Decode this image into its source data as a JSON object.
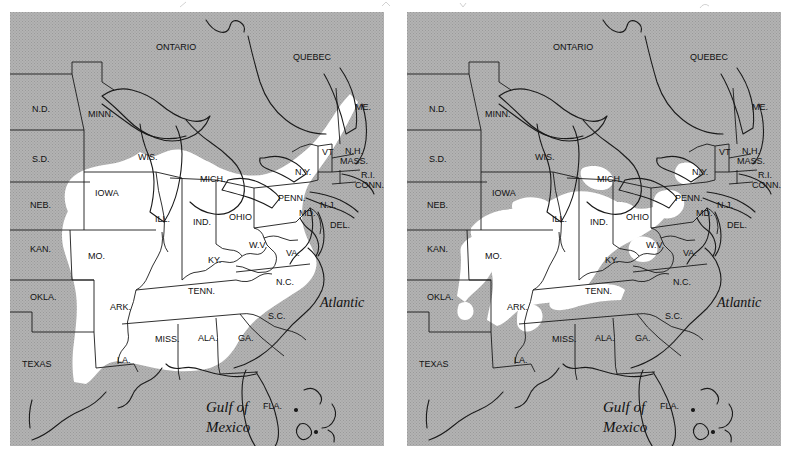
{
  "figure": {
    "type": "two-panel-range-map",
    "panel_count": 2,
    "background_color": "#ffffff",
    "land_shade_color": "#b4b4b4",
    "range_fill_color": "#ffffff",
    "outline_color": "#1a1a1a"
  },
  "maps": [
    {
      "id": "map-left",
      "position": "left",
      "ocean_labels": [
        {
          "text": "Atlantic",
          "x": 310,
          "y": 295,
          "style": "italic-serif",
          "size": 14
        },
        {
          "text": "Gulf of",
          "x": 196,
          "y": 400,
          "style": "italic-serif",
          "size": 15
        },
        {
          "text": "Mexico",
          "x": 196,
          "y": 420,
          "style": "italic-serif",
          "size": 15
        }
      ],
      "labels": [
        {
          "text": "ONTARIO",
          "x": 146,
          "y": 38
        },
        {
          "text": "QUEBEC",
          "x": 283,
          "y": 48
        },
        {
          "text": "N.D.",
          "x": 22,
          "y": 100
        },
        {
          "text": "MINN.",
          "x": 78,
          "y": 105
        },
        {
          "text": "S.D.",
          "x": 22,
          "y": 150
        },
        {
          "text": "WIS.",
          "x": 128,
          "y": 148
        },
        {
          "text": "MICH.",
          "x": 190,
          "y": 170
        },
        {
          "text": "N.Y.",
          "x": 285,
          "y": 163
        },
        {
          "text": "ME.",
          "x": 345,
          "y": 98
        },
        {
          "text": "VT",
          "x": 312,
          "y": 143
        },
        {
          "text": "N.H.",
          "x": 335,
          "y": 142
        },
        {
          "text": "MASS.",
          "x": 330,
          "y": 152
        },
        {
          "text": "R.I.",
          "x": 351,
          "y": 166
        },
        {
          "text": "CONN.",
          "x": 345,
          "y": 176
        },
        {
          "text": "NEB.",
          "x": 20,
          "y": 196
        },
        {
          "text": "IOWA",
          "x": 85,
          "y": 184
        },
        {
          "text": "ILL.",
          "x": 145,
          "y": 210
        },
        {
          "text": "IND.",
          "x": 183,
          "y": 213
        },
        {
          "text": "OHIO",
          "x": 219,
          "y": 208
        },
        {
          "text": "PENN.",
          "x": 268,
          "y": 189
        },
        {
          "text": "N.J.",
          "x": 310,
          "y": 196
        },
        {
          "text": "MD.",
          "x": 289,
          "y": 204
        },
        {
          "text": "DEL.",
          "x": 320,
          "y": 216
        },
        {
          "text": "KAN.",
          "x": 20,
          "y": 240
        },
        {
          "text": "MO.",
          "x": 78,
          "y": 247
        },
        {
          "text": "KY.",
          "x": 198,
          "y": 251
        },
        {
          "text": "W.V.",
          "x": 239,
          "y": 236
        },
        {
          "text": "VA.",
          "x": 276,
          "y": 244
        },
        {
          "text": "OKLA.",
          "x": 20,
          "y": 288
        },
        {
          "text": "ARK.",
          "x": 100,
          "y": 298
        },
        {
          "text": "TENN.",
          "x": 178,
          "y": 282
        },
        {
          "text": "N.C.",
          "x": 266,
          "y": 273
        },
        {
          "text": "S.C.",
          "x": 258,
          "y": 307
        },
        {
          "text": "MISS.",
          "x": 145,
          "y": 330
        },
        {
          "text": "ALA.",
          "x": 188,
          "y": 329
        },
        {
          "text": "GA.",
          "x": 228,
          "y": 329
        },
        {
          "text": "TEXAS",
          "x": 12,
          "y": 355
        },
        {
          "text": "LA.",
          "x": 107,
          "y": 351
        },
        {
          "text": "FLA.",
          "x": 253,
          "y": 397
        }
      ]
    },
    {
      "id": "map-right",
      "position": "right",
      "ocean_labels": [
        {
          "text": "Atlantic",
          "x": 310,
          "y": 295,
          "style": "italic-serif",
          "size": 14
        },
        {
          "text": "Gulf of",
          "x": 196,
          "y": 400,
          "style": "italic-serif",
          "size": 15
        },
        {
          "text": "Mexico",
          "x": 196,
          "y": 420,
          "style": "italic-serif",
          "size": 15
        }
      ],
      "labels": [
        {
          "text": "ONTARIO",
          "x": 146,
          "y": 38
        },
        {
          "text": "QUEBEC",
          "x": 283,
          "y": 48
        },
        {
          "text": "N.D.",
          "x": 22,
          "y": 100
        },
        {
          "text": "MINN.",
          "x": 78,
          "y": 105
        },
        {
          "text": "S.D.",
          "x": 22,
          "y": 150
        },
        {
          "text": "WIS.",
          "x": 128,
          "y": 148
        },
        {
          "text": "MICH.",
          "x": 190,
          "y": 170
        },
        {
          "text": "N.Y.",
          "x": 285,
          "y": 163
        },
        {
          "text": "ME.",
          "x": 345,
          "y": 98
        },
        {
          "text": "VT",
          "x": 312,
          "y": 143
        },
        {
          "text": "N.H.",
          "x": 335,
          "y": 142
        },
        {
          "text": "MASS.",
          "x": 330,
          "y": 152
        },
        {
          "text": "R.I.",
          "x": 351,
          "y": 166
        },
        {
          "text": "CONN.",
          "x": 345,
          "y": 176
        },
        {
          "text": "NEB.",
          "x": 20,
          "y": 196
        },
        {
          "text": "IOWA",
          "x": 85,
          "y": 184
        },
        {
          "text": "ILL.",
          "x": 145,
          "y": 210
        },
        {
          "text": "IND.",
          "x": 183,
          "y": 213
        },
        {
          "text": "OHIO",
          "x": 219,
          "y": 208
        },
        {
          "text": "PENN.",
          "x": 268,
          "y": 189
        },
        {
          "text": "N.J.",
          "x": 310,
          "y": 196
        },
        {
          "text": "MD.",
          "x": 289,
          "y": 204
        },
        {
          "text": "DEL.",
          "x": 320,
          "y": 216
        },
        {
          "text": "KAN.",
          "x": 20,
          "y": 240
        },
        {
          "text": "MO.",
          "x": 78,
          "y": 247
        },
        {
          "text": "KY.",
          "x": 198,
          "y": 251
        },
        {
          "text": "W.V.",
          "x": 239,
          "y": 236
        },
        {
          "text": "VA.",
          "x": 276,
          "y": 244
        },
        {
          "text": "OKLA.",
          "x": 20,
          "y": 288
        },
        {
          "text": "ARK.",
          "x": 100,
          "y": 298
        },
        {
          "text": "TENN.",
          "x": 178,
          "y": 282
        },
        {
          "text": "N.C.",
          "x": 266,
          "y": 273
        },
        {
          "text": "S.C.",
          "x": 258,
          "y": 307
        },
        {
          "text": "MISS.",
          "x": 145,
          "y": 330
        },
        {
          "text": "ALA.",
          "x": 188,
          "y": 329
        },
        {
          "text": "GA.",
          "x": 228,
          "y": 329
        },
        {
          "text": "TEXAS",
          "x": 12,
          "y": 355
        },
        {
          "text": "LA.",
          "x": 107,
          "y": 351
        },
        {
          "text": "FLA.",
          "x": 253,
          "y": 397
        }
      ]
    }
  ]
}
